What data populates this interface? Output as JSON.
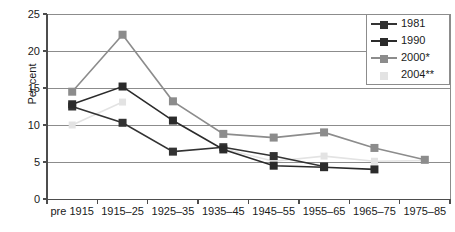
{
  "chart_data": {
    "type": "line",
    "title": "",
    "xlabel": "",
    "ylabel": "Per cent",
    "ylim": [
      0,
      25
    ],
    "yticks": [
      0,
      5,
      10,
      15,
      20,
      25
    ],
    "grid": true,
    "legend_position": "top-right",
    "categories": [
      "pre 1915",
      "1915–25",
      "1925–35",
      "1935–45",
      "1945–55",
      "1955–65",
      "1965–75",
      "1975–85"
    ],
    "series": [
      {
        "name": "1981",
        "color": "#333333",
        "marker": "square",
        "values": [
          12.5,
          10.3,
          6.4,
          7.0,
          5.8,
          4.4,
          null,
          null
        ]
      },
      {
        "name": "1990",
        "color": "#2b2b2b",
        "marker": "square",
        "values": [
          12.8,
          15.2,
          10.6,
          6.7,
          4.5,
          4.3,
          4.0,
          null
        ]
      },
      {
        "name": "2000*",
        "color": "#8c8c8c",
        "marker": "square",
        "values": [
          14.5,
          22.2,
          13.2,
          8.8,
          8.3,
          9.0,
          6.9,
          5.3
        ]
      },
      {
        "name": "2004**",
        "color": "#e3e3e3",
        "marker": "square",
        "values": [
          10.0,
          13.1,
          null,
          6.8,
          5.1,
          5.8,
          5.1,
          5.2
        ]
      }
    ]
  },
  "legend": {
    "items": [
      {
        "label": "1981"
      },
      {
        "label": "1990"
      },
      {
        "label": "2000*"
      },
      {
        "label": "2004**"
      }
    ]
  },
  "axes": {
    "y_title": "Per cent",
    "y_tick_labels": [
      "25",
      "20",
      "15",
      "10",
      "5",
      "0"
    ],
    "x_tick_labels": [
      "pre 1915",
      "1915–25",
      "1925–35",
      "1935–45",
      "1945–55",
      "1955–65",
      "1965–75",
      "1975–85"
    ]
  },
  "colors": {
    "series_1981": "#333333",
    "series_1990": "#2b2b2b",
    "series_2000": "#8c8c8c",
    "series_2004": "#e3e3e3",
    "grid": "#8c8c8c",
    "axis": "#4d4d4d"
  }
}
